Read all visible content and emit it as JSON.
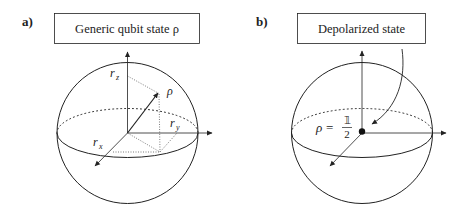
{
  "panels": [
    {
      "label": "a)",
      "title": "Generic qubit state ρ",
      "vector_label": "ρ",
      "component_labels": {
        "x": "r",
        "x_sub": "x",
        "y": "r",
        "y_sub": "y",
        "z": "r",
        "z_sub": "z"
      }
    },
    {
      "label": "b)",
      "title": "Depolarized state",
      "state_label": {
        "lhs": "ρ",
        "eq": "=",
        "numerator": "𝟙",
        "denominator": "2"
      }
    }
  ],
  "colors": {
    "stroke": "#222222",
    "background": "#ffffff"
  }
}
